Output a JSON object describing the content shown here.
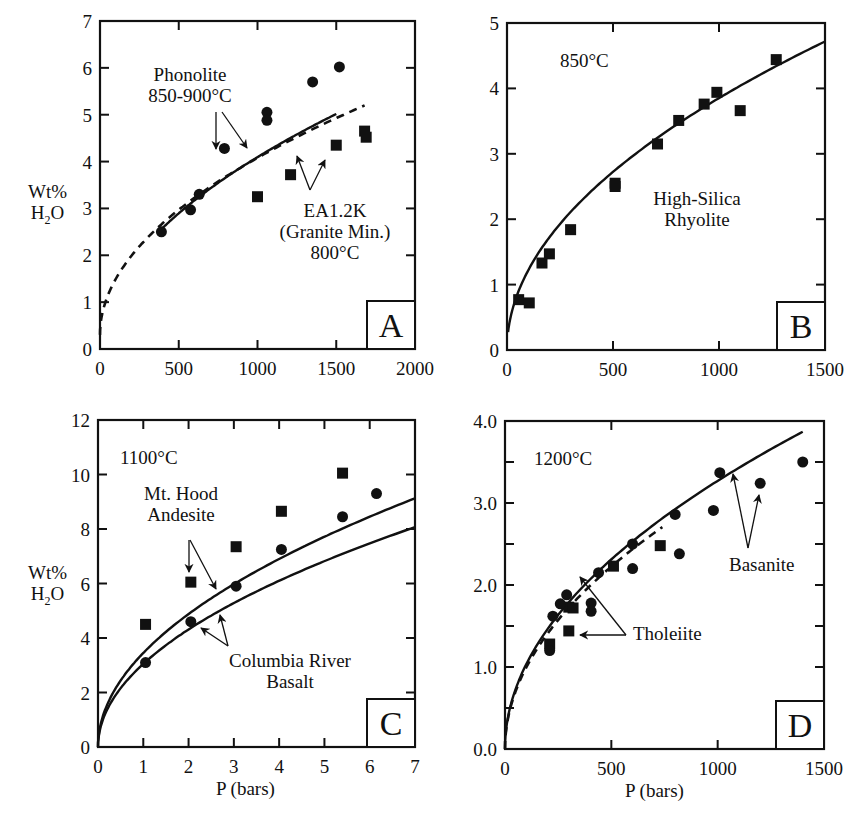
{
  "figure": {
    "ylabel_line1": "Wt%",
    "ylabel_line2_main": "H",
    "ylabel_line2_sub": "2",
    "ylabel_line2_end": "O",
    "xlabel": "P (bars)"
  },
  "chart_data": [
    {
      "panel": "A",
      "type": "scatter",
      "title": "",
      "xlabel": "",
      "ylabel": "Wt% H2O",
      "xlim": [
        0,
        2000
      ],
      "ylim": [
        0,
        7
      ],
      "xticks": [
        0,
        500,
        1000,
        1500,
        2000
      ],
      "yticks": [
        0,
        1,
        2,
        3,
        4,
        5,
        6,
        7
      ],
      "xtick_labels": [
        "0",
        "500",
        "1000",
        "1500",
        "2000"
      ],
      "ytick_labels": [
        "0",
        "1",
        "2",
        "3",
        "4",
        "5",
        "6",
        "7"
      ],
      "grid": false,
      "box": {
        "x0": 100,
        "y0": 21,
        "x1": 415,
        "y1": 349
      },
      "series": [
        {
          "name": "Phonolite 850-900°C",
          "marker": "circle",
          "points": [
            [
              390,
              2.5
            ],
            [
              575,
              2.97
            ],
            [
              630,
              3.3
            ],
            [
              790,
              4.28
            ],
            [
              1060,
              5.05
            ],
            [
              1060,
              4.88
            ],
            [
              1350,
              5.7
            ],
            [
              1520,
              6.02
            ]
          ]
        },
        {
          "name": "EA1.2K (Granite Min.) 800°C",
          "marker": "square",
          "points": [
            [
              1000,
              3.25
            ],
            [
              1210,
              3.72
            ],
            [
              1500,
              4.35
            ],
            [
              1680,
              4.65
            ],
            [
              1690,
              4.52
            ]
          ]
        }
      ],
      "curves": [
        {
          "name": "Phonolite model",
          "style": "solid",
          "p_from": 390,
          "p_to": 1500,
          "k": 0.1295,
          "n": 0.5
        },
        {
          "name": "EA1.2K model",
          "style": "dashed",
          "p_from": 0,
          "p_to": 1680,
          "k": 0.1195,
          "n": 0.5,
          "offset": 0.3
        }
      ],
      "annotations": [
        {
          "lines": [
            "Phonolite",
            "850-900°C"
          ],
          "x": 190,
          "y": 81
        },
        {
          "lines": [
            "EA1.2K",
            "(Granite Min.)",
            "800°C"
          ],
          "x": 335,
          "y": 217
        }
      ],
      "arrows": [
        {
          "from": [
            216,
            112
          ],
          "to": [
            216,
            149
          ]
        },
        {
          "from": [
            222,
            112
          ],
          "to": [
            247,
            148
          ]
        },
        {
          "from": [
            310,
            190
          ],
          "to": [
            297,
            156
          ]
        },
        {
          "from": [
            310,
            190
          ],
          "to": [
            325,
            160
          ]
        }
      ],
      "panel_label": "A"
    },
    {
      "panel": "B",
      "type": "scatter",
      "title": "",
      "xlabel": "",
      "ylabel": "",
      "xlim": [
        0,
        1500
      ],
      "ylim": [
        0,
        5
      ],
      "xticks": [
        0,
        500,
        1000,
        1500
      ],
      "yticks": [
        0,
        1,
        2,
        3,
        4,
        5
      ],
      "xtick_labels": [
        "0",
        "500",
        "1000",
        "1500"
      ],
      "ytick_labels": [
        "0",
        "1",
        "2",
        "3",
        "4",
        "5"
      ],
      "grid": false,
      "box": {
        "x0": 507,
        "y0": 23,
        "x1": 825,
        "y1": 350
      },
      "series": [
        {
          "name": "High-Silica Rhyolite",
          "marker": "square",
          "points": [
            [
              55,
              0.77
            ],
            [
              105,
              0.72
            ],
            [
              165,
              1.33
            ],
            [
              200,
              1.47
            ],
            [
              300,
              1.84
            ],
            [
              510,
              2.55
            ],
            [
              510,
              2.5
            ],
            [
              710,
              3.15
            ],
            [
              810,
              3.51
            ],
            [
              930,
              3.76
            ],
            [
              990,
              3.94
            ],
            [
              1100,
              3.66
            ],
            [
              1270,
              4.44
            ]
          ]
        }
      ],
      "curves": [
        {
          "name": "Rhyolite model",
          "style": "solid",
          "p_from": 5,
          "p_to": 1500,
          "k": 0.1218,
          "n": 0.5
        }
      ],
      "annotations": [
        {
          "lines": [
            "850°C"
          ],
          "x": 560,
          "y": 67
        },
        {
          "lines": [
            "High-Silica",
            "Rhyolite"
          ],
          "x": 697,
          "y": 205
        }
      ],
      "arrows": [],
      "panel_label": "B"
    },
    {
      "panel": "C",
      "type": "scatter",
      "title": "",
      "xlabel": "P (bars)",
      "ylabel": "Wt% H2O",
      "xlim": [
        0,
        7
      ],
      "ylim": [
        0,
        12
      ],
      "xticks": [
        0,
        1,
        2,
        3,
        4,
        5,
        6,
        7
      ],
      "yticks": [
        0,
        2,
        4,
        6,
        8,
        10,
        12
      ],
      "xtick_labels": [
        "0",
        "1",
        "2",
        "3",
        "4",
        "5",
        "6",
        "7"
      ],
      "ytick_labels": [
        "0",
        "2",
        "4",
        "6",
        "8",
        "10",
        "12"
      ],
      "grid": false,
      "box": {
        "x0": 98,
        "y0": 420,
        "x1": 415,
        "y1": 747
      },
      "series": [
        {
          "name": "Mt. Hood Andesite",
          "marker": "square",
          "points": [
            [
              1.05,
              4.5
            ],
            [
              2.05,
              6.05
            ],
            [
              3.05,
              7.35
            ],
            [
              4.05,
              8.65
            ],
            [
              5.4,
              10.05
            ]
          ]
        },
        {
          "name": "Columbia River Basalt",
          "marker": "circle",
          "points": [
            [
              1.05,
              3.1
            ],
            [
              2.05,
              4.6
            ],
            [
              3.05,
              5.9
            ],
            [
              4.05,
              7.25
            ],
            [
              5.4,
              8.45
            ],
            [
              6.15,
              9.3
            ]
          ]
        }
      ],
      "curves": [
        {
          "name": "Andesite model",
          "style": "solid",
          "p_from": 0,
          "p_to": 7,
          "k": 3.45,
          "n": 0.5
        },
        {
          "name": "Basalt model",
          "style": "solid",
          "p_from": 0,
          "p_to": 7,
          "k": 3.05,
          "n": 0.5
        }
      ],
      "annotations": [
        {
          "lines": [
            "1100°C"
          ],
          "x": 120,
          "y": 464
        },
        {
          "lines": [
            "Mt. Hood",
            "Andesite"
          ],
          "x": 181,
          "y": 500
        },
        {
          "lines": [
            "Columbia River",
            "Basalt"
          ],
          "x": 290,
          "y": 667
        }
      ],
      "arrows": [
        {
          "from": [
            189,
            540
          ],
          "to": [
            189,
            572
          ]
        },
        {
          "from": [
            190,
            540
          ],
          "to": [
            216,
            589
          ]
        },
        {
          "from": [
            228,
            646
          ],
          "to": [
            201,
            628
          ]
        },
        {
          "from": [
            228,
            646
          ],
          "to": [
            220,
            615
          ]
        }
      ],
      "panel_label": "C"
    },
    {
      "panel": "D",
      "type": "scatter",
      "title": "",
      "xlabel": "P (bars)",
      "ylabel": "",
      "xlim": [
        0,
        1500
      ],
      "ylim": [
        0,
        4.0
      ],
      "xticks": [
        0,
        500,
        1000,
        1500
      ],
      "yticks": [
        0,
        0.5,
        1.0,
        1.5,
        2.0,
        2.5,
        3.0,
        3.5,
        4.0
      ],
      "xtick_labels": [
        "0",
        "500",
        "1000",
        "1500"
      ],
      "ytick_labels": [
        "0.0",
        "",
        "1.0",
        "",
        "2.0",
        "",
        "3.0",
        "",
        "4.0"
      ],
      "grid": false,
      "box": {
        "x0": 505,
        "y0": 421,
        "x1": 824,
        "y1": 749
      },
      "series": [
        {
          "name": "Tholeiite",
          "marker": "square",
          "points": [
            [
              210,
              1.28
            ],
            [
              300,
              1.44
            ],
            [
              300,
              1.73
            ],
            [
              320,
              1.72
            ],
            [
              510,
              2.23
            ],
            [
              730,
              2.48
            ]
          ]
        },
        {
          "name": "Tholeiite / Basanite",
          "marker": "circle",
          "points": [
            [
              210,
              1.2
            ],
            [
              225,
              1.62
            ],
            [
              260,
              1.77
            ],
            [
              290,
              1.88
            ],
            [
              405,
              1.78
            ],
            [
              405,
              1.68
            ],
            [
              440,
              2.15
            ],
            [
              600,
              2.5
            ],
            [
              600,
              2.2
            ],
            [
              800,
              2.86
            ],
            [
              820,
              2.38
            ],
            [
              980,
              2.91
            ],
            [
              1010,
              3.37
            ],
            [
              1200,
              3.24
            ],
            [
              1400,
              3.5
            ]
          ]
        }
      ],
      "curves": [
        {
          "name": "Basanite model",
          "style": "solid",
          "p_from": 0,
          "p_to": 1400,
          "k": 0.1034,
          "n": 0.5
        },
        {
          "name": "Tholeiite model",
          "style": "dashed",
          "p_from": 0,
          "p_to": 740,
          "k": 0.0995,
          "n": 0.5
        }
      ],
      "annotations": [
        {
          "lines": [
            "1200°C"
          ],
          "x": 534,
          "y": 465
        },
        {
          "lines": [
            "Tholeiite"
          ],
          "x": 633,
          "y": 640
        },
        {
          "lines": [
            "Basanite"
          ],
          "x": 729,
          "y": 571
        }
      ],
      "arrows": [
        {
          "from": [
            626,
            635
          ],
          "to": [
            580,
            577
          ]
        },
        {
          "from": [
            626,
            635
          ],
          "to": [
            580,
            635
          ]
        },
        {
          "from": [
            748,
            548
          ],
          "to": [
            733,
            474
          ]
        },
        {
          "from": [
            748,
            548
          ],
          "to": [
            759,
            495
          ]
        }
      ],
      "panel_label": "D"
    }
  ]
}
